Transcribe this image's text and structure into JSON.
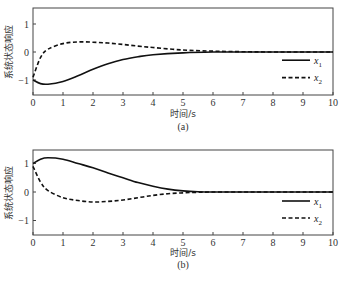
{
  "chart_data": [
    {
      "type": "line",
      "panel": "(a)",
      "title": "",
      "caption": "(a)",
      "xlabel": "时间/s",
      "ylabel": "系统状态响应",
      "xlim": [
        0,
        10
      ],
      "ylim": [
        -1.5,
        1.5
      ],
      "xticks": [
        0,
        1,
        2,
        3,
        4,
        5,
        6,
        7,
        8,
        9,
        10
      ],
      "yticks": [
        -1,
        0,
        1
      ],
      "grid": false,
      "legend_position": "right, middle-lower",
      "x": [
        0,
        0.25,
        0.5,
        1,
        1.5,
        2,
        2.5,
        3,
        3.5,
        4,
        5,
        6,
        7,
        8,
        9,
        10
      ],
      "series": [
        {
          "name": "x1",
          "style": "solid",
          "values": [
            -1.0,
            -1.13,
            -1.15,
            -1.05,
            -0.85,
            -0.62,
            -0.42,
            -0.27,
            -0.17,
            -0.1,
            -0.03,
            0.0,
            0.0,
            0.0,
            0.0,
            0.0
          ]
        },
        {
          "name": "x2",
          "style": "dashed",
          "values": [
            -0.9,
            -0.2,
            0.1,
            0.3,
            0.36,
            0.35,
            0.32,
            0.27,
            0.21,
            0.16,
            0.07,
            0.03,
            0.01,
            0.0,
            0.0,
            0.0
          ]
        }
      ]
    },
    {
      "type": "line",
      "panel": "(b)",
      "title": "",
      "caption": "(b)",
      "xlabel": "时间/s",
      "ylabel": "系统状态响应",
      "xlim": [
        0,
        10
      ],
      "ylim": [
        -1.5,
        1.5
      ],
      "xticks": [
        0,
        1,
        2,
        3,
        4,
        5,
        6,
        7,
        8,
        9,
        10
      ],
      "yticks": [
        -1,
        0,
        1
      ],
      "grid": false,
      "legend_position": "right, middle-lower",
      "x": [
        0,
        0.25,
        0.5,
        1,
        1.5,
        2,
        2.5,
        3,
        3.5,
        4,
        4.5,
        5,
        5.5,
        6,
        7,
        8,
        9,
        10
      ],
      "series": [
        {
          "name": "x1",
          "style": "solid",
          "values": [
            1.0,
            1.15,
            1.2,
            1.15,
            1.0,
            0.85,
            0.67,
            0.5,
            0.33,
            0.2,
            0.1,
            0.04,
            0.01,
            0.0,
            0.0,
            0.0,
            0.0,
            0.0
          ]
        },
        {
          "name": "x2",
          "style": "dashed",
          "values": [
            0.9,
            0.35,
            0.05,
            -0.2,
            -0.3,
            -0.35,
            -0.33,
            -0.28,
            -0.2,
            -0.12,
            -0.06,
            -0.03,
            -0.01,
            0.0,
            0.0,
            0.0,
            0.0,
            0.0
          ]
        }
      ]
    }
  ],
  "legend": {
    "x1_main": "x",
    "x1_sub": "1",
    "x2_main": "x",
    "x2_sub": "2"
  },
  "labels": {
    "xlabel": "时间/s",
    "ylabel": "系统状态响应",
    "caption_a": "(a)",
    "caption_b": "(b)",
    "yticks": [
      "1",
      "0",
      "−1"
    ],
    "xticks": [
      "0",
      "1",
      "2",
      "3",
      "4",
      "5",
      "6",
      "7",
      "8",
      "9",
      "10"
    ]
  }
}
